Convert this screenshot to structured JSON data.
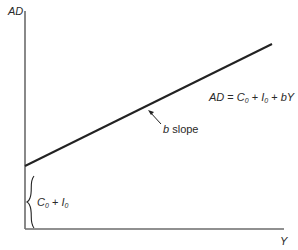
{
  "axes": {
    "y_label": "AD",
    "x_label": "Y"
  },
  "line": {
    "equation_parts": {
      "lhs": "AD",
      "eq": " = ",
      "c": "C",
      "c_sub": "0",
      "plus1": " + ",
      "i": "I",
      "i_sub": "0",
      "plus2": " + ",
      "by": "bY"
    },
    "slope_label_var": "b",
    "slope_label_text": " slope"
  },
  "intercept": {
    "c": "C",
    "c_sub": "0",
    "plus": " + ",
    "i": "I",
    "i_sub": "0"
  },
  "colors": {
    "axis": "#6b6b6b",
    "line": "#222222",
    "text": "#2a2a2a"
  }
}
